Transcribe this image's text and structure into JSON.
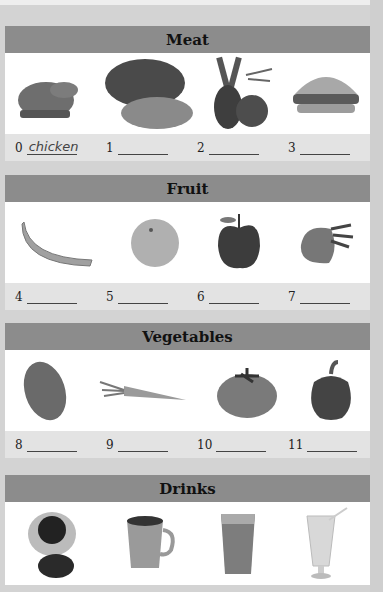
{
  "sections": [
    {
      "title": "Meat",
      "items": [
        {
          "number": "0",
          "picture": "chicken-image",
          "answer": "chicken"
        },
        {
          "number": "1",
          "picture": "beef-image",
          "answer": ""
        },
        {
          "number": "2",
          "picture": "lamb-chops-image",
          "answer": ""
        },
        {
          "number": "3",
          "picture": "burger-image",
          "answer": ""
        }
      ]
    },
    {
      "title": "Fruit",
      "items": [
        {
          "number": "4",
          "picture": "banana-image",
          "answer": ""
        },
        {
          "number": "5",
          "picture": "orange-image",
          "answer": ""
        },
        {
          "number": "6",
          "picture": "apple-image",
          "answer": ""
        },
        {
          "number": "7",
          "picture": "strawberry-image",
          "answer": ""
        }
      ]
    },
    {
      "title": "Vegetables",
      "items": [
        {
          "number": "8",
          "picture": "potato-image",
          "answer": ""
        },
        {
          "number": "9",
          "picture": "carrot-image",
          "answer": ""
        },
        {
          "number": "10",
          "picture": "tomato-image",
          "answer": ""
        },
        {
          "number": "11",
          "picture": "pepper-image",
          "answer": ""
        }
      ]
    },
    {
      "title": "Drinks",
      "items": [
        {
          "picture": "coffee-image"
        },
        {
          "picture": "tea-mug-image"
        },
        {
          "picture": "milkshake-glass-image"
        },
        {
          "picture": "juice-glass-image"
        }
      ]
    }
  ],
  "colors": {
    "header_bar": "#8c8c8c",
    "label_strip": "#e3e3e3",
    "background": "#d3d3d3"
  }
}
